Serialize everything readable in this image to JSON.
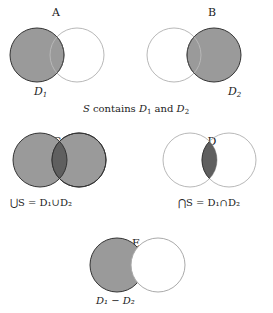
{
  "colors": {
    "fill": "#9a9a9a",
    "fill_dark": "#5f5f5f",
    "stroke_dark": "#333333",
    "stroke_light": "#b5b5b5"
  },
  "panels": [
    {
      "id": "A",
      "label": "A",
      "caption_parts": [
        "D",
        "1"
      ],
      "description": "D1 shaded"
    },
    {
      "id": "B",
      "label": "B",
      "caption_parts": [
        "D",
        "2"
      ],
      "description": "D2 shaded"
    },
    {
      "id": "C",
      "label": "C",
      "caption": "⋃S = D₁∪D₂",
      "description": "union shaded"
    },
    {
      "id": "D",
      "label": "D",
      "caption": "⋂S = D₁∩D₂",
      "description": "intersection shaded"
    },
    {
      "id": "E",
      "label": "E",
      "caption": "D₁ − D₂",
      "description": "difference shaded"
    }
  ],
  "middle_caption": {
    "prefix": "S",
    "text": " contains ",
    "d1": "D",
    "d1_sub": "1",
    "and": " and ",
    "d2": "D",
    "d2_sub": "2"
  },
  "captions": {
    "a_d": "D",
    "a_sub": "1",
    "b_d": "D",
    "b_sub": "2",
    "c_text": "⋃S = D₁∪D₂",
    "d_text": "⋂S = D₁∩D₂",
    "e_text": "D₁ − D₂"
  }
}
